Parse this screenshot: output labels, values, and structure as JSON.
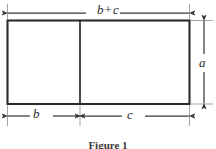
{
  "figure": {
    "caption": "Figure 1",
    "labels": {
      "top_total": "b + c",
      "top_total_left": "b",
      "top_total_op": "+",
      "top_total_right": "c",
      "bottom_left": "b",
      "bottom_right": "c",
      "right_height": "a"
    },
    "colors": {
      "stroke": "#2b2b2b",
      "dimension_line": "#3a3a3a",
      "background": "#ffffff",
      "text": "#2b2b2b"
    },
    "geometry": {
      "rect_left": 7,
      "rect_top": 20,
      "rect_right": 190,
      "rect_bottom": 104,
      "divider_x": 80,
      "top_dimension_y": 13,
      "bottom_dimension_y": 116,
      "right_dimension_x": 204
    }
  }
}
